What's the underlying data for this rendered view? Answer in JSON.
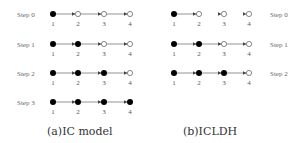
{
  "panels": [
    {
      "id": "a",
      "caption": "(a)IC model",
      "label_side": "left",
      "steps": [
        {
          "label": "Step 0",
          "nodes": [
            "active",
            "inactive",
            "inactive",
            "inactive"
          ],
          "edges": [
            true,
            true,
            true
          ]
        },
        {
          "label": "Step 1",
          "nodes": [
            "active",
            "active",
            "inactive",
            "inactive"
          ],
          "edges": [
            true,
            true,
            true
          ]
        },
        {
          "label": "Step 2",
          "nodes": [
            "active",
            "active",
            "active",
            "inactive"
          ],
          "edges": [
            true,
            true,
            true
          ]
        },
        {
          "label": "Step 3",
          "nodes": [
            "active",
            "active",
            "active",
            "active"
          ],
          "edges": [
            true,
            true,
            true
          ]
        }
      ],
      "node_labels": [
        "1",
        "2",
        "3",
        "4"
      ]
    },
    {
      "id": "b",
      "caption": "(b)ICLDH",
      "label_side": "right",
      "steps": [
        {
          "label": "Step 0",
          "nodes": [
            "active",
            "inactive",
            "inactive",
            "inactive"
          ],
          "edges": [
            true,
            false,
            false
          ]
        },
        {
          "label": "Step 1",
          "nodes": [
            "active",
            "active",
            "inactive",
            "inactive"
          ],
          "edges": [
            true,
            true,
            true
          ]
        },
        {
          "label": "Step 2",
          "nodes": [
            "active",
            "active",
            "active",
            "inactive"
          ],
          "edges": [
            true,
            true,
            true
          ]
        }
      ],
      "node_labels": [
        "1",
        "2",
        "3",
        "4"
      ]
    }
  ],
  "colors": {
    "active": "#000000",
    "inactive_stroke": "#555555",
    "edge": "#666666",
    "text": "#555555"
  }
}
